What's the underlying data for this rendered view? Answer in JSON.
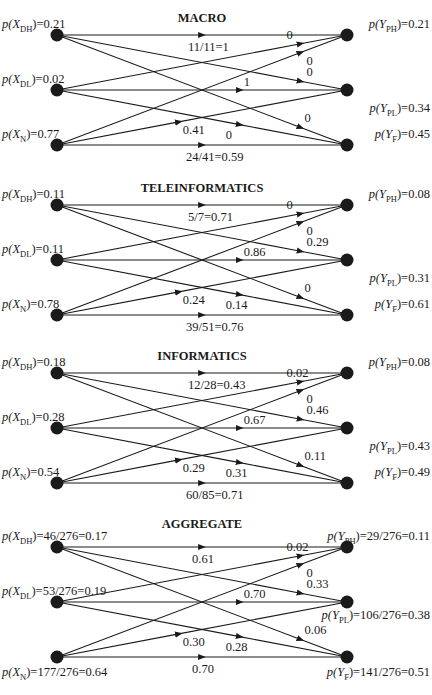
{
  "figure": {
    "panels": [
      {
        "title": "MACRO",
        "sources": [
          {
            "id": "XDH",
            "var": "X",
            "sub": "DH",
            "value": "0.21"
          },
          {
            "id": "XDL",
            "var": "X",
            "sub": "DL",
            "value": "0.02"
          },
          {
            "id": "XN",
            "var": "X",
            "sub": "N",
            "value": "0.77"
          }
        ],
        "sinks": [
          {
            "id": "YPH",
            "var": "Y",
            "sub": "PH",
            "value": "0.21"
          },
          {
            "id": "YPL",
            "var": "Y",
            "sub": "PL",
            "value": "0.34"
          },
          {
            "id": "YF",
            "var": "Y",
            "sub": "F",
            "value": "0.45"
          }
        ],
        "edges": [
          {
            "from": 0,
            "to": 0,
            "label": "11/11=1"
          },
          {
            "from": 0,
            "to": 1,
            "label": "0"
          },
          {
            "from": 0,
            "to": 2,
            "label": "0"
          },
          {
            "from": 1,
            "to": 0,
            "label": "0"
          },
          {
            "from": 1,
            "to": 1,
            "label": "1"
          },
          {
            "from": 1,
            "to": 2,
            "label": "0"
          },
          {
            "from": 2,
            "to": 0,
            "label": "0"
          },
          {
            "from": 2,
            "to": 1,
            "label": "0.41"
          },
          {
            "from": 2,
            "to": 2,
            "label": "24/41=0.59"
          }
        ]
      },
      {
        "title": "TELEINFORMATICS",
        "sources": [
          {
            "id": "XDH",
            "var": "X",
            "sub": "DH",
            "value": "0.11"
          },
          {
            "id": "XDL",
            "var": "X",
            "sub": "DL",
            "value": "0.11"
          },
          {
            "id": "XN",
            "var": "X",
            "sub": "N",
            "value": "0.78"
          }
        ],
        "sinks": [
          {
            "id": "YPH",
            "var": "Y",
            "sub": "PH",
            "value": "0.08"
          },
          {
            "id": "YPL",
            "var": "Y",
            "sub": "PL",
            "value": "0.31"
          },
          {
            "id": "YF",
            "var": "Y",
            "sub": "F",
            "value": "0.61"
          }
        ],
        "edges": [
          {
            "from": 0,
            "to": 0,
            "label": "5/7=0.71"
          },
          {
            "from": 0,
            "to": 1,
            "label": "0.29"
          },
          {
            "from": 0,
            "to": 2,
            "label": "0"
          },
          {
            "from": 1,
            "to": 0,
            "label": "0"
          },
          {
            "from": 1,
            "to": 1,
            "label": "0.86"
          },
          {
            "from": 1,
            "to": 2,
            "label": "0.14"
          },
          {
            "from": 2,
            "to": 0,
            "label": "0"
          },
          {
            "from": 2,
            "to": 1,
            "label": "0.24"
          },
          {
            "from": 2,
            "to": 2,
            "label": "39/51=0.76"
          }
        ]
      },
      {
        "title": "INFORMATICS",
        "sources": [
          {
            "id": "XDH",
            "var": "X",
            "sub": "DH",
            "value": "0.18"
          },
          {
            "id": "XDL",
            "var": "X",
            "sub": "DL",
            "value": "0.28"
          },
          {
            "id": "XN",
            "var": "X",
            "sub": "N",
            "value": "0.54"
          }
        ],
        "sinks": [
          {
            "id": "YPH",
            "var": "Y",
            "sub": "PH",
            "value": "0.08"
          },
          {
            "id": "YPL",
            "var": "Y",
            "sub": "PL",
            "value": "0.43"
          },
          {
            "id": "YF",
            "var": "Y",
            "sub": "F",
            "value": "0.49"
          }
        ],
        "edges": [
          {
            "from": 0,
            "to": 0,
            "label": "12/28=0.43"
          },
          {
            "from": 0,
            "to": 1,
            "label": "0.46"
          },
          {
            "from": 0,
            "to": 2,
            "label": "0.11"
          },
          {
            "from": 1,
            "to": 0,
            "label": "0.02"
          },
          {
            "from": 1,
            "to": 1,
            "label": "0.67"
          },
          {
            "from": 1,
            "to": 2,
            "label": "0.31"
          },
          {
            "from": 2,
            "to": 0,
            "label": "0"
          },
          {
            "from": 2,
            "to": 1,
            "label": "0.29"
          },
          {
            "from": 2,
            "to": 2,
            "label": "60/85=0.71"
          }
        ]
      },
      {
        "title": "AGGREGATE",
        "sources": [
          {
            "id": "XDH",
            "var": "X",
            "sub": "DH",
            "value": "46/276=0.17"
          },
          {
            "id": "XDL",
            "var": "X",
            "sub": "DL",
            "value": "53/276=0.19"
          },
          {
            "id": "XN",
            "var": "X",
            "sub": "N",
            "value": "177/276=0.64"
          }
        ],
        "sinks": [
          {
            "id": "YPH",
            "var": "Y",
            "sub": "PH",
            "value": "29/276=0.11"
          },
          {
            "id": "YPL",
            "var": "Y",
            "sub": "PL",
            "value": "106/276=0.38"
          },
          {
            "id": "YF",
            "var": "Y",
            "sub": "F",
            "value": "141/276=0.51"
          }
        ],
        "edges": [
          {
            "from": 0,
            "to": 0,
            "label": "0.61"
          },
          {
            "from": 0,
            "to": 1,
            "label": "0.33"
          },
          {
            "from": 0,
            "to": 2,
            "label": "0.06"
          },
          {
            "from": 1,
            "to": 0,
            "label": "0.02"
          },
          {
            "from": 1,
            "to": 1,
            "label": "0.70"
          },
          {
            "from": 1,
            "to": 2,
            "label": "0.28"
          },
          {
            "from": 2,
            "to": 0,
            "label": "0"
          },
          {
            "from": 2,
            "to": 1,
            "label": "0.30"
          },
          {
            "from": 2,
            "to": 2,
            "label": "0.70"
          }
        ]
      }
    ]
  },
  "colors": {
    "ink": "#1a1a1a",
    "background": "#ffffff"
  }
}
